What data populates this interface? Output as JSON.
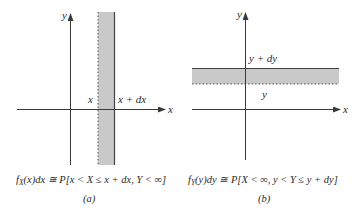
{
  "colors": {
    "axis": "#3a3a3a",
    "shade": "#c9c9c9",
    "boundary": "#555555",
    "text": "#2a2a2a",
    "background": "#ffffff"
  },
  "panel_a": {
    "axis_x_label": "x",
    "axis_y_label": "y",
    "lower_bound_label": "x",
    "upper_bound_label": "x + dx",
    "formula": "fX(x)dx ≅ P[x < X ≤ x + dx, Y < ∞]",
    "formula_parts": {
      "f": "f",
      "sub": "X",
      "rest": "(x)dx ≅ P[x < X ≤ x + dx, Y < ∞]"
    },
    "caption": "(a)",
    "shading": "vertical strip between x and x + dx"
  },
  "panel_b": {
    "axis_x_label": "x",
    "axis_y_label": "y",
    "lower_bound_label": "y",
    "upper_bound_label": "y + dy",
    "formula": "fY(y)dy ≅ P[X < ∞, y < Y ≤ y + dy]",
    "formula_parts": {
      "f": "f",
      "sub": "Y",
      "rest": "(y)dy ≅ P[X < ∞, y < Y ≤ y + dy]"
    },
    "caption": "(b)",
    "shading": "horizontal strip between y and y + dy"
  }
}
